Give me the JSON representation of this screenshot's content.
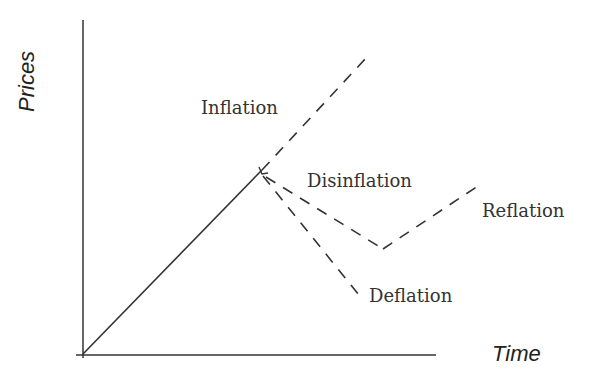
{
  "diagram": {
    "axes": {
      "y_label": "Prices",
      "x_label": "Time"
    },
    "labels": {
      "inflation": "Inflation",
      "disinflation": "Disinflation",
      "reflation": "Reflation",
      "deflation": "Deflation"
    },
    "colors": {
      "line": "#333333",
      "text": "#333333",
      "background": "#ffffff"
    },
    "paths": [
      {
        "name": "historical-rise",
        "style": "solid",
        "points": [
          [
            82,
            354
          ],
          [
            262,
            170
          ]
        ]
      },
      {
        "name": "inflation",
        "style": "dashed",
        "points": [
          [
            262,
            170
          ],
          [
            367,
            57
          ]
        ]
      },
      {
        "name": "disinflation",
        "style": "dashed",
        "points": [
          [
            262,
            170
          ],
          [
            383,
            249
          ]
        ]
      },
      {
        "name": "reflation",
        "style": "dashed",
        "points": [
          [
            383,
            249
          ],
          [
            478,
            186
          ]
        ]
      },
      {
        "name": "deflation",
        "style": "dashed",
        "points": [
          [
            262,
            170
          ],
          [
            364,
            300
          ]
        ]
      }
    ]
  }
}
